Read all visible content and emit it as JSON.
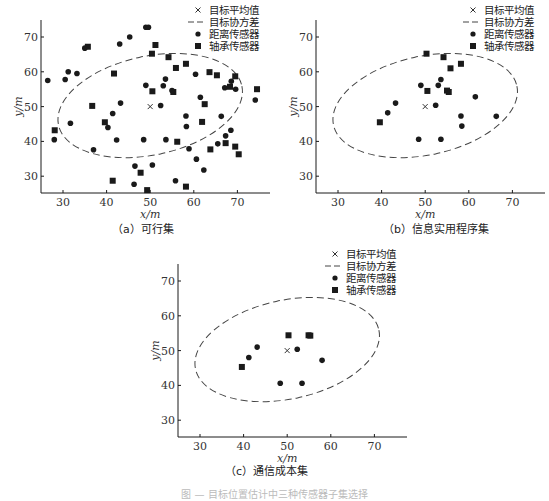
{
  "figure_caption": "图 — 目标位置估计中三种传感器子集选择",
  "legend": {
    "mean": "目标平均值",
    "covariance": "目标协方差",
    "range": "距离传感器",
    "bearing": "轴承传感器"
  },
  "captions": {
    "a": "（a）可行集",
    "b": "（b）信息实用程序集",
    "c": "（c）通信成本集"
  },
  "chart_data": [
    {
      "id": "a",
      "type": "scatter",
      "title": "（a）可行集",
      "xlabel": "x/m",
      "ylabel": "y/m",
      "xlim": [
        25,
        75
      ],
      "ylim": [
        25,
        75
      ],
      "xticks": [
        30,
        40,
        50,
        60,
        70
      ],
      "yticks": [
        30,
        40,
        50,
        60,
        70
      ],
      "grid": false,
      "legend_position": "upper right",
      "target_mean": [
        50,
        50
      ],
      "covariance_ellipse": {
        "cx": 50,
        "cy": 50.3,
        "rx": 21.5,
        "ry": 14.2,
        "rotation_deg": -12
      },
      "series": [
        {
          "name": "距离传感器",
          "marker": "circle",
          "points": [
            [
              26.5,
              57.5
            ],
            [
              28,
              40.5
            ],
            [
              30.5,
              57.8
            ],
            [
              31.2,
              60
            ],
            [
              31.7,
              45.2
            ],
            [
              33.2,
              59.5
            ],
            [
              35,
              66.8
            ],
            [
              37,
              37.6
            ],
            [
              40.3,
              44
            ],
            [
              41.4,
              48
            ],
            [
              42.3,
              40.4
            ],
            [
              43,
              68
            ],
            [
              43.2,
              51
            ],
            [
              45.3,
              70
            ],
            [
              46.3,
              27.7
            ],
            [
              46.5,
              32.9
            ],
            [
              48.5,
              40.5
            ],
            [
              49,
              56.1
            ],
            [
              49,
              72.8
            ],
            [
              49.6,
              72.8
            ],
            [
              50.5,
              33.2
            ],
            [
              52.4,
              50.3
            ],
            [
              53,
              56
            ],
            [
              53.5,
              57.9
            ],
            [
              53.6,
              40.5
            ],
            [
              55,
              54.6
            ],
            [
              55.8,
              28.7
            ],
            [
              58.2,
              47.3
            ],
            [
              58.3,
              44.3
            ],
            [
              58.9,
              37.9
            ],
            [
              60.4,
              59.3
            ],
            [
              60.6,
              34.9
            ],
            [
              61.5,
              52.7
            ],
            [
              62.3,
              31.8
            ],
            [
              65.5,
              39.3
            ],
            [
              66.3,
              47.2
            ],
            [
              67.1,
              55.4
            ],
            [
              67.3,
              41.6
            ],
            [
              68.5,
              43.2
            ],
            [
              68.6,
              57.3
            ],
            [
              69.6,
              55
            ],
            [
              74.1,
              51.9
            ]
          ]
        },
        {
          "name": "轴承传感器",
          "marker": "square",
          "points": [
            [
              28.1,
              43.2
            ],
            [
              35.7,
              67.2
            ],
            [
              36.7,
              50.2
            ],
            [
              39.6,
              45.5
            ],
            [
              41.4,
              28.7
            ],
            [
              41.7,
              59.5
            ],
            [
              47.8,
              31
            ],
            [
              49.3,
              26
            ],
            [
              50.4,
              65.2
            ],
            [
              50.5,
              54.4
            ],
            [
              51.2,
              67.7
            ],
            [
              54.2,
              64.2
            ],
            [
              55.3,
              54.2
            ],
            [
              55.9,
              61.1
            ],
            [
              56.2,
              39.9
            ],
            [
              58.2,
              27
            ],
            [
              58.2,
              62.3
            ],
            [
              61.9,
              45.6
            ],
            [
              62.5,
              50.7
            ],
            [
              63.6,
              59.9
            ],
            [
              63.8,
              37.7
            ],
            [
              65.3,
              59
            ],
            [
              67.3,
              39.5
            ],
            [
              68.3,
              55.7
            ],
            [
              69.5,
              58.7
            ],
            [
              69.5,
              38.5
            ],
            [
              70.3,
              36.3
            ],
            [
              74.5,
              55
            ]
          ]
        }
      ]
    },
    {
      "id": "b",
      "type": "scatter",
      "title": "（b）信息实用程序集",
      "xlabel": "x/m",
      "ylabel": "y/m",
      "xlim": [
        25,
        75
      ],
      "ylim": [
        25,
        75
      ],
      "xticks": [
        30,
        40,
        50,
        60,
        70
      ],
      "yticks": [
        30,
        40,
        50,
        60,
        70
      ],
      "grid": false,
      "legend_position": "upper right",
      "target_mean": [
        50,
        50
      ],
      "covariance_ellipse": {
        "cx": 50,
        "cy": 50.3,
        "rx": 21.5,
        "ry": 14.2,
        "rotation_deg": -12
      },
      "series": [
        {
          "name": "距离传感器",
          "marker": "circle",
          "points": [
            [
              41.4,
              48.2
            ],
            [
              43.2,
              51
            ],
            [
              48.5,
              40.6
            ],
            [
              49,
              56.1
            ],
            [
              52.4,
              50.4
            ],
            [
              53,
              56.1
            ],
            [
              53.6,
              57.8
            ],
            [
              53.6,
              40.6
            ],
            [
              58.2,
              47.3
            ],
            [
              58.4,
              44.4
            ],
            [
              61.5,
              52.8
            ],
            [
              66.3,
              47.2
            ]
          ]
        },
        {
          "name": "轴承传感器",
          "marker": "square",
          "points": [
            [
              39.6,
              45.5
            ],
            [
              50.3,
              65.2
            ],
            [
              50.5,
              54.5
            ],
            [
              54.2,
              64.2
            ],
            [
              55,
              54.6
            ],
            [
              55.4,
              54.2
            ],
            [
              55.8,
              61
            ],
            [
              58.2,
              62.3
            ]
          ]
        }
      ]
    },
    {
      "id": "c",
      "type": "scatter",
      "title": "（c）通信成本集",
      "xlabel": "x/m",
      "ylabel": "y/m",
      "xlim": [
        25,
        75
      ],
      "ylim": [
        25,
        75
      ],
      "xticks": [
        30,
        40,
        50,
        60,
        70
      ],
      "yticks": [
        30,
        40,
        50,
        60,
        70
      ],
      "grid": false,
      "legend_position": "upper right",
      "target_mean": [
        50,
        50
      ],
      "covariance_ellipse": {
        "cx": 50,
        "cy": 50.3,
        "rx": 21.5,
        "ry": 14.2,
        "rotation_deg": -12
      },
      "series": [
        {
          "name": "距离传感器",
          "marker": "circle",
          "points": [
            [
              41.2,
              48
            ],
            [
              43.1,
              51
            ],
            [
              48.4,
              40.6
            ],
            [
              52.3,
              50.4
            ],
            [
              53.4,
              40.6
            ],
            [
              58,
              47.2
            ]
          ]
        },
        {
          "name": "轴承传感器",
          "marker": "square",
          "points": [
            [
              39.6,
              45.3
            ],
            [
              50.3,
              54.4
            ],
            [
              54.9,
              54.4
            ],
            [
              55.3,
              54.3
            ]
          ]
        }
      ]
    }
  ]
}
